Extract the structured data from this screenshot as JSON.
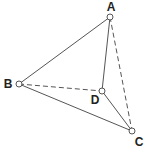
{
  "diagram": {
    "type": "tetrahedron",
    "stroke_color": "#555555",
    "vertices": [
      {
        "id": "A",
        "label": "A",
        "x": 110,
        "y": 17,
        "lx": 111,
        "ly": 11
      },
      {
        "id": "B",
        "label": "B",
        "x": 19,
        "y": 84,
        "lx": 8,
        "ly": 88
      },
      {
        "id": "C",
        "label": "C",
        "x": 132,
        "y": 131,
        "lx": 139,
        "ly": 146
      },
      {
        "id": "D",
        "label": "D",
        "x": 102,
        "y": 91,
        "lx": 95,
        "ly": 104
      }
    ],
    "edges": [
      {
        "from": "A",
        "to": "B",
        "style": "solid"
      },
      {
        "from": "A",
        "to": "D",
        "style": "solid"
      },
      {
        "from": "B",
        "to": "C",
        "style": "solid"
      },
      {
        "from": "D",
        "to": "C",
        "style": "solid"
      },
      {
        "from": "B",
        "to": "D",
        "style": "dashed"
      },
      {
        "from": "A",
        "to": "C",
        "style": "dashed"
      }
    ]
  }
}
